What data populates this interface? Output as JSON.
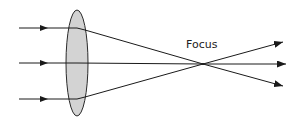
{
  "diagram": {
    "focus_label": "Focus",
    "colors": {
      "background": "#ffffff",
      "lens_fill": "#d3d3d3",
      "lens_stroke": "#2a2a2a",
      "ray": "#1a1a1a"
    },
    "incoming_rays": [
      {
        "name": "top",
        "y": 28
      },
      {
        "name": "middle",
        "y": 63
      },
      {
        "name": "bottom",
        "y": 99
      }
    ],
    "lens": {
      "type": "biconvex",
      "cx": 77,
      "cy": 63,
      "rx": 11,
      "ry": 53
    },
    "focus_point": {
      "x": 203,
      "y": 64
    },
    "outgoing_rays": [
      {
        "name": "upper",
        "end_x": 283,
        "end_y": 42
      },
      {
        "name": "middle",
        "end_x": 286,
        "end_y": 64
      },
      {
        "name": "lower",
        "end_x": 283,
        "end_y": 86
      }
    ]
  }
}
